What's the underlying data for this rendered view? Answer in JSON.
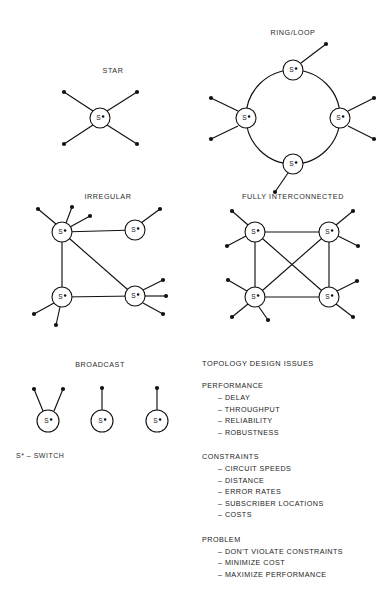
{
  "page": {
    "background": "#ffffff",
    "ink": "#111111"
  },
  "diagrams": [
    {
      "id": "star",
      "title": "STAR",
      "title_x": 113,
      "title_y": 73,
      "nodes": [
        {
          "name": "switch",
          "x": 100,
          "y": 118,
          "r": 10,
          "label": "S"
        }
      ],
      "links": [],
      "spokes": [
        {
          "x1": 93,
          "y1": 111,
          "x2": 64,
          "y2": 92
        },
        {
          "x1": 107,
          "y1": 111,
          "x2": 137,
          "y2": 92
        },
        {
          "x1": 93,
          "y1": 125,
          "x2": 64,
          "y2": 144
        },
        {
          "x1": 107,
          "y1": 125,
          "x2": 137,
          "y2": 144
        }
      ],
      "endpoints": [
        {
          "x": 64,
          "y": 92
        },
        {
          "x": 137,
          "y": 92
        },
        {
          "x": 64,
          "y": 144
        },
        {
          "x": 137,
          "y": 144
        }
      ]
    },
    {
      "id": "ring-loop",
      "title": "RING/LOOP",
      "title_x": 293,
      "title_y": 35,
      "nodes": [
        {
          "name": "switch-top",
          "x": 293,
          "y": 70,
          "r": 10,
          "label": "S"
        },
        {
          "name": "switch-left",
          "x": 246,
          "y": 118,
          "r": 10,
          "label": "S"
        },
        {
          "name": "switch-right",
          "x": 340,
          "y": 118,
          "r": 10,
          "label": "S"
        },
        {
          "name": "switch-bottom",
          "x": 293,
          "y": 164,
          "r": 10,
          "label": "S"
        }
      ],
      "ring": {
        "cx": 293,
        "cy": 117,
        "rx": 47,
        "ry": 47
      },
      "spokes": [
        {
          "x1": 301,
          "y1": 63,
          "x2": 326,
          "y2": 44
        },
        {
          "x1": 238,
          "y1": 111,
          "x2": 211,
          "y2": 98
        },
        {
          "x1": 238,
          "y1": 126,
          "x2": 211,
          "y2": 139
        },
        {
          "x1": 348,
          "y1": 111,
          "x2": 374,
          "y2": 98
        },
        {
          "x1": 348,
          "y1": 126,
          "x2": 374,
          "y2": 139
        },
        {
          "x1": 288,
          "y1": 173,
          "x2": 275,
          "y2": 192
        }
      ],
      "endpoints": [
        {
          "x": 326,
          "y": 44
        },
        {
          "x": 211,
          "y": 98
        },
        {
          "x": 211,
          "y": 139
        },
        {
          "x": 374,
          "y": 98
        },
        {
          "x": 374,
          "y": 139
        },
        {
          "x": 275,
          "y": 192
        }
      ]
    },
    {
      "id": "irregular",
      "title": "IRREGULAR",
      "title_x": 108,
      "title_y": 199,
      "nodes": [
        {
          "name": "switch-a",
          "x": 62,
          "y": 232,
          "r": 10,
          "label": "S"
        },
        {
          "name": "switch-b",
          "x": 135,
          "y": 230,
          "r": 10,
          "label": "S"
        },
        {
          "name": "switch-c",
          "x": 62,
          "y": 297,
          "r": 10,
          "label": "S"
        },
        {
          "name": "switch-d",
          "x": 135,
          "y": 296,
          "r": 10,
          "label": "S"
        }
      ],
      "links": [
        {
          "from": "switch-a",
          "to": "switch-b"
        },
        {
          "from": "switch-a",
          "to": "switch-c"
        },
        {
          "from": "switch-a",
          "to": "switch-d"
        },
        {
          "from": "switch-c",
          "to": "switch-d"
        }
      ],
      "spokes": [
        {
          "x1": 56,
          "y1": 224,
          "x2": 38,
          "y2": 209
        },
        {
          "x1": 66,
          "y1": 223,
          "x2": 72,
          "y2": 207
        },
        {
          "x1": 70,
          "y1": 227,
          "x2": 90,
          "y2": 216
        },
        {
          "x1": 141,
          "y1": 223,
          "x2": 160,
          "y2": 209
        },
        {
          "x1": 54,
          "y1": 303,
          "x2": 34,
          "y2": 314
        },
        {
          "x1": 60,
          "y1": 307,
          "x2": 56,
          "y2": 325
        },
        {
          "x1": 143,
          "y1": 290,
          "x2": 163,
          "y2": 280
        },
        {
          "x1": 145,
          "y1": 296,
          "x2": 166,
          "y2": 296
        },
        {
          "x1": 143,
          "y1": 303,
          "x2": 163,
          "y2": 314
        }
      ],
      "endpoints": [
        {
          "x": 38,
          "y": 209
        },
        {
          "x": 72,
          "y": 207
        },
        {
          "x": 90,
          "y": 216
        },
        {
          "x": 160,
          "y": 209
        },
        {
          "x": 34,
          "y": 314
        },
        {
          "x": 56,
          "y": 325
        },
        {
          "x": 163,
          "y": 280
        },
        {
          "x": 166,
          "y": 296
        },
        {
          "x": 163,
          "y": 314
        }
      ]
    },
    {
      "id": "fully-interconnected",
      "title": "FULLY INTERCONNECTED",
      "title_x": 293,
      "title_y": 199,
      "nodes": [
        {
          "name": "switch-a",
          "x": 255,
          "y": 232,
          "r": 10,
          "label": "S"
        },
        {
          "name": "switch-b",
          "x": 329,
          "y": 232,
          "r": 10,
          "label": "S"
        },
        {
          "name": "switch-c",
          "x": 255,
          "y": 297,
          "r": 10,
          "label": "S"
        },
        {
          "name": "switch-d",
          "x": 329,
          "y": 297,
          "r": 10,
          "label": "S"
        }
      ],
      "links": [
        {
          "from": "switch-a",
          "to": "switch-b"
        },
        {
          "from": "switch-a",
          "to": "switch-c"
        },
        {
          "from": "switch-a",
          "to": "switch-d"
        },
        {
          "from": "switch-b",
          "to": "switch-c"
        },
        {
          "from": "switch-b",
          "to": "switch-d"
        },
        {
          "from": "switch-c",
          "to": "switch-d"
        }
      ],
      "spokes": [
        {
          "x1": 248,
          "y1": 225,
          "x2": 232,
          "y2": 211
        },
        {
          "x1": 246,
          "y1": 236,
          "x2": 227,
          "y2": 246
        },
        {
          "x1": 336,
          "y1": 225,
          "x2": 353,
          "y2": 211
        },
        {
          "x1": 338,
          "y1": 236,
          "x2": 358,
          "y2": 246
        },
        {
          "x1": 247,
          "y1": 291,
          "x2": 228,
          "y2": 280
        },
        {
          "x1": 248,
          "y1": 304,
          "x2": 232,
          "y2": 317
        },
        {
          "x1": 259,
          "y1": 307,
          "x2": 268,
          "y2": 320
        },
        {
          "x1": 337,
          "y1": 291,
          "x2": 357,
          "y2": 281
        },
        {
          "x1": 336,
          "y1": 304,
          "x2": 353,
          "y2": 317
        }
      ],
      "endpoints": [
        {
          "x": 232,
          "y": 211
        },
        {
          "x": 227,
          "y": 246
        },
        {
          "x": 353,
          "y": 211
        },
        {
          "x": 358,
          "y": 246
        },
        {
          "x": 228,
          "y": 280
        },
        {
          "x": 232,
          "y": 317
        },
        {
          "x": 268,
          "y": 320
        },
        {
          "x": 357,
          "y": 281
        },
        {
          "x": 353,
          "y": 317
        }
      ]
    },
    {
      "id": "broadcast",
      "title": "BROADCAST",
      "title_x": 100,
      "title_y": 367,
      "nodes": [
        {
          "name": "switch-1",
          "x": 48,
          "y": 421,
          "r": 11,
          "label": "S"
        },
        {
          "name": "switch-2",
          "x": 102,
          "y": 421,
          "r": 11,
          "label": "S"
        },
        {
          "name": "switch-3",
          "x": 157,
          "y": 421,
          "r": 11,
          "label": "S"
        }
      ],
      "spokes": [
        {
          "x1": 43,
          "y1": 411,
          "x2": 34,
          "y2": 389
        },
        {
          "x1": 54,
          "y1": 411,
          "x2": 63,
          "y2": 389
        },
        {
          "x1": 102,
          "y1": 410,
          "x2": 102,
          "y2": 388
        },
        {
          "x1": 157,
          "y1": 410,
          "x2": 157,
          "y2": 388
        }
      ],
      "endpoints": [
        {
          "x": 34,
          "y": 389
        },
        {
          "x": 63,
          "y": 389
        },
        {
          "x": 102,
          "y": 388
        },
        {
          "x": 157,
          "y": 388
        }
      ]
    }
  ],
  "legend": {
    "text": "S* – SWITCH",
    "x": 16,
    "y": 458
  },
  "issues": {
    "title": "TOPOLOGY DESIGN ISSUES",
    "x": 202,
    "y": 366,
    "groups": [
      {
        "name": "PERFORMANCE",
        "items": [
          "DELAY",
          "THROUGHPUT",
          "RELIABILITY",
          "ROBUSTNESS"
        ]
      },
      {
        "name": "CONSTRAINTS",
        "items": [
          "CIRCUIT SPEEDS",
          "DISTANCE",
          "ERROR RATES",
          "SUBSCRIBER LOCATIONS",
          "COSTS"
        ]
      },
      {
        "name": "PROBLEM",
        "items": [
          "DON'T VIOLATE CONSTRAINTS",
          "MINIMIZE COST",
          "MAXIMIZE PERFORMANCE"
        ]
      }
    ],
    "bullet": "–"
  }
}
